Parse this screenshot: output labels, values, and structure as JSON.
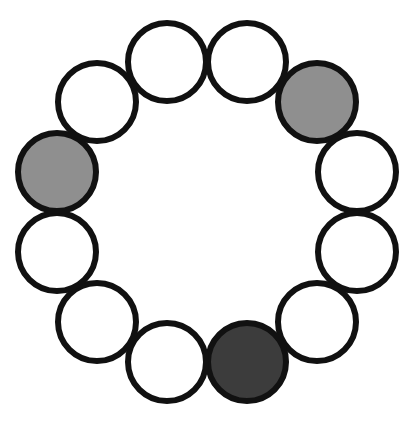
{
  "figure": {
    "background_color": "#ffffff",
    "canvas": {
      "width": 414,
      "height": 421
    }
  },
  "palette": {
    "outline": "#111111",
    "white_fill": "#ffffff",
    "light_gray_fill": "#8f8f8f",
    "dark_gray_fill": "#3c3c3c"
  },
  "ring": {
    "center_x": 207,
    "center_y": 212,
    "ring_radius": 155,
    "circle_radius": 39,
    "stroke_width": 6,
    "count": 12,
    "angle_step_degrees": 30,
    "angle_offset_degrees": -105
  },
  "chart_data": {
    "type": "scatter",
    "xlabel": "",
    "ylabel": "",
    "xlim": [
      0,
      414
    ],
    "ylim": [
      0,
      421
    ],
    "grid": false,
    "legend": "none",
    "categories": [
      "node-1",
      "node-2",
      "node-3",
      "node-4",
      "node-5",
      "node-6",
      "node-7",
      "node-8",
      "node-9",
      "node-10",
      "node-11",
      "node-12"
    ],
    "nodes": [
      {
        "id": 1,
        "label": "node-1",
        "angle_deg": -105,
        "cx": 167,
        "cy": 62,
        "r": 39,
        "fill": "#ffffff",
        "fill_name": "white",
        "state": "empty"
      },
      {
        "id": 2,
        "label": "node-2",
        "angle_deg": -75,
        "cx": 247,
        "cy": 62,
        "r": 39,
        "fill": "#ffffff",
        "fill_name": "white",
        "state": "empty"
      },
      {
        "id": 3,
        "label": "node-3",
        "angle_deg": -45,
        "cx": 317,
        "cy": 102,
        "r": 39,
        "fill": "#8f8f8f",
        "fill_name": "light-gray",
        "state": "filled-light"
      },
      {
        "id": 4,
        "label": "node-4",
        "angle_deg": -15,
        "cx": 357,
        "cy": 172,
        "r": 39,
        "fill": "#ffffff",
        "fill_name": "white",
        "state": "empty"
      },
      {
        "id": 5,
        "label": "node-5",
        "angle_deg": 15,
        "cx": 357,
        "cy": 252,
        "r": 39,
        "fill": "#ffffff",
        "fill_name": "white",
        "state": "empty"
      },
      {
        "id": 6,
        "label": "node-6",
        "angle_deg": 45,
        "cx": 317,
        "cy": 322,
        "r": 39,
        "fill": "#ffffff",
        "fill_name": "white",
        "state": "empty"
      },
      {
        "id": 7,
        "label": "node-7",
        "angle_deg": 75,
        "cx": 247,
        "cy": 362,
        "r": 39,
        "fill": "#3c3c3c",
        "fill_name": "dark-gray",
        "state": "filled-dark"
      },
      {
        "id": 8,
        "label": "node-8",
        "angle_deg": 105,
        "cx": 167,
        "cy": 362,
        "r": 39,
        "fill": "#ffffff",
        "fill_name": "white",
        "state": "empty"
      },
      {
        "id": 9,
        "label": "node-9",
        "angle_deg": 135,
        "cx": 97,
        "cy": 322,
        "r": 39,
        "fill": "#ffffff",
        "fill_name": "white",
        "state": "empty"
      },
      {
        "id": 10,
        "label": "node-10",
        "angle_deg": 165,
        "cx": 57,
        "cy": 252,
        "r": 39,
        "fill": "#ffffff",
        "fill_name": "white",
        "state": "empty"
      },
      {
        "id": 11,
        "label": "node-11",
        "angle_deg": 195,
        "cx": 57,
        "cy": 172,
        "r": 39,
        "fill": "#8f8f8f",
        "fill_name": "light-gray",
        "state": "filled-light"
      },
      {
        "id": 12,
        "label": "node-12",
        "angle_deg": 225,
        "cx": 97,
        "cy": 102,
        "r": 39,
        "fill": "#ffffff",
        "fill_name": "white",
        "state": "empty"
      }
    ],
    "counts": {
      "total": 12,
      "white": 9,
      "light_gray": 2,
      "dark_gray": 1
    }
  }
}
